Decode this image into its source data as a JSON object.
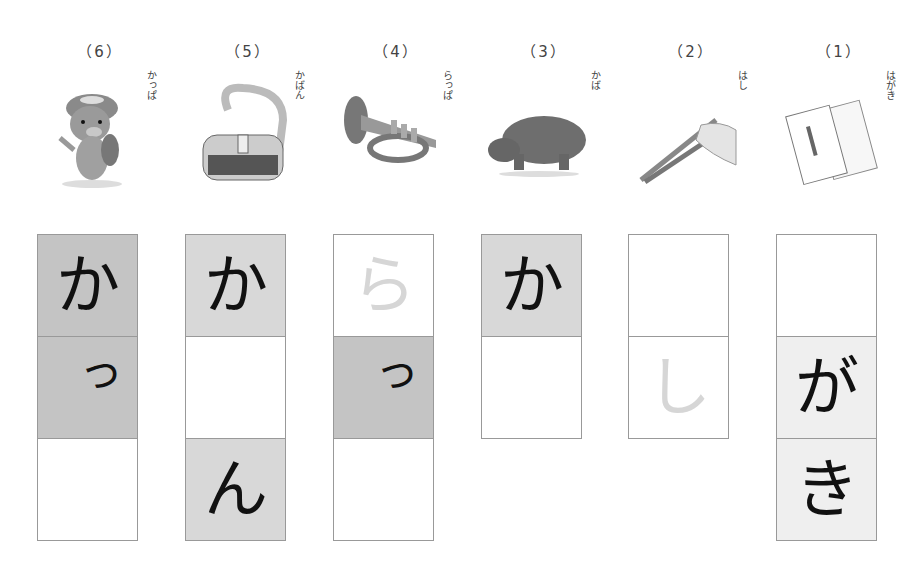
{
  "columns": [
    {
      "number": "（6）",
      "reading": "かっぱ",
      "picture": "kappa",
      "cells": [
        {
          "char": "か",
          "style": "dark"
        },
        {
          "char": "っ",
          "style": "dark",
          "small": true
        },
        {
          "char": "",
          "style": "white"
        }
      ]
    },
    {
      "number": "（5）",
      "reading": "かばん",
      "picture": "bag",
      "cells": [
        {
          "char": "か",
          "style": "mid"
        },
        {
          "char": "",
          "style": "white"
        },
        {
          "char": "ん",
          "style": "mid"
        }
      ]
    },
    {
      "number": "（4）",
      "reading": "らっぱ",
      "picture": "trumpet",
      "cells": [
        {
          "char": "ら",
          "style": "white",
          "ghost": true
        },
        {
          "char": "っ",
          "style": "dark",
          "small": true
        },
        {
          "char": "",
          "style": "white"
        }
      ]
    },
    {
      "number": "（3）",
      "reading": "かば",
      "picture": "hippo",
      "cells": [
        {
          "char": "か",
          "style": "mid"
        },
        {
          "char": "",
          "style": "white"
        }
      ]
    },
    {
      "number": "（2）",
      "reading": "はし",
      "picture": "chopsticks",
      "cells": [
        {
          "char": "",
          "style": "white"
        },
        {
          "char": "し",
          "style": "white",
          "ghost": true
        }
      ]
    },
    {
      "number": "（1）",
      "reading": "はがき",
      "picture": "postcards",
      "cells": [
        {
          "char": "",
          "style": "white"
        },
        {
          "char": "が",
          "style": "light"
        },
        {
          "char": "き",
          "style": "light"
        }
      ]
    }
  ]
}
